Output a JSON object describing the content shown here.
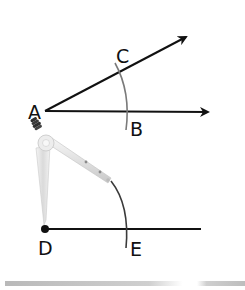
{
  "diagram": {
    "labels": {
      "A": "A",
      "B": "B",
      "C": "C",
      "D": "D",
      "E": "E"
    },
    "elements": [
      {
        "type": "ray",
        "from": "A",
        "through": "C",
        "description": "upper ray of angle"
      },
      {
        "type": "ray",
        "from": "A",
        "through": "B",
        "description": "lower ray of angle"
      },
      {
        "type": "arc",
        "center": "A",
        "crosses": [
          "C",
          "B"
        ],
        "color": "#7a7a7a"
      },
      {
        "type": "segment",
        "from": "D",
        "through": "E"
      },
      {
        "type": "arc",
        "center": "D",
        "crosses": [
          "E"
        ],
        "drawn_by": "compass",
        "color": "#444444"
      },
      {
        "type": "compass",
        "pivot_point": "D"
      }
    ],
    "colors": {
      "line": "#111111",
      "arc_top": "#7a7a7a",
      "arc_bottom": "#3a3a3a",
      "compass_body": "#e6e6e6",
      "compass_handle": "#333333"
    }
  }
}
